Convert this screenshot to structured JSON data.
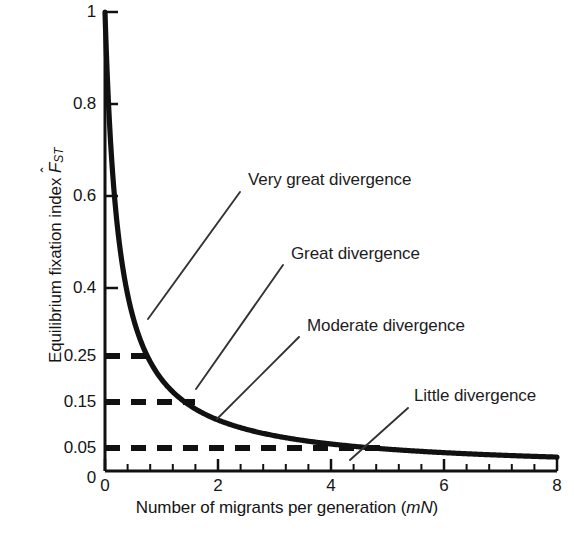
{
  "chart_data": {
    "type": "line",
    "title": "",
    "xlabel": "Number of migrants per generation (mN)",
    "xlabel_plain": "Number of migrants per generation",
    "xlabel_italic_suffix": "mN",
    "ylabel": "Equilibrium fixation index F̂ST",
    "ylabel_plain": "Equilibrium fixation index",
    "ylabel_symbol_base": "F",
    "ylabel_symbol_hat": "ˆ",
    "ylabel_symbol_sub": "ST",
    "xlim": [
      0,
      8
    ],
    "ylim": [
      0,
      1
    ],
    "grid": false,
    "legend": "none",
    "x_ticks": [
      0,
      2,
      4,
      6,
      8
    ],
    "x_tick_labels": [
      "0",
      "2",
      "4",
      "6",
      "8"
    ],
    "x_minor_tick_step": 0.4,
    "y_ticks": [
      0,
      0.05,
      0.15,
      0.25,
      0.4,
      0.6,
      0.8,
      1
    ],
    "y_tick_labels": [
      "0",
      "0.05",
      "0.15",
      "0.25",
      "0.4",
      "0.6",
      "0.8",
      "1"
    ],
    "series": [
      {
        "name": "Equilibrium Fst = 1 / (1 + 4mN)",
        "formula": "Fst = 1/(1+4*mN)",
        "x": [
          0.22,
          0.3,
          0.4,
          0.5,
          0.6,
          0.7,
          0.8,
          0.9,
          1.0,
          1.2,
          1.4,
          1.6,
          1.8,
          2.0,
          2.4,
          2.8,
          3.2,
          3.6,
          4.0,
          4.4,
          4.8,
          5.2,
          5.6,
          6.0,
          6.5,
          7.0,
          7.5,
          8.0
        ],
        "y": [
          0.532,
          0.455,
          0.385,
          0.333,
          0.294,
          0.263,
          0.238,
          0.217,
          0.2,
          0.172,
          0.152,
          0.135,
          0.122,
          0.111,
          0.094,
          0.082,
          0.072,
          0.065,
          0.059,
          0.054,
          0.049,
          0.046,
          0.043,
          0.04,
          0.037,
          0.034,
          0.032,
          0.03
        ]
      }
    ],
    "reference_lines": [
      {
        "name": "fst-0.25-dashed",
        "y": 0.25,
        "x_start": 0,
        "x_end": 0.75,
        "style": "dashed"
      },
      {
        "name": "fst-0.15-dashed",
        "y": 0.15,
        "x_start": 0,
        "x_end": 1.42,
        "style": "dashed"
      },
      {
        "name": "fst-0.05-dashed",
        "y": 0.05,
        "x_start": 0,
        "x_end": 4.7,
        "style": "dashed"
      }
    ],
    "annotations": [
      {
        "name": "very-great-divergence",
        "label": "Very great divergence",
        "text_x": 248,
        "text_y": 172,
        "leader_from_x": 240,
        "leader_from_y": 192,
        "leader_to_x": 148,
        "leader_to_y": 319
      },
      {
        "name": "great-divergence",
        "label": "Great divergence",
        "text_x": 291,
        "text_y": 246,
        "leader_from_x": 283,
        "leader_from_y": 265,
        "leader_to_x": 196,
        "leader_to_y": 389
      },
      {
        "name": "moderate-divergence",
        "label": "Moderate divergence",
        "text_x": 307,
        "text_y": 318,
        "leader_from_x": 299,
        "leader_from_y": 337,
        "leader_to_x": 217,
        "leader_to_y": 419
      },
      {
        "name": "little-divergence",
        "label": "Little divergence",
        "text_x": 414,
        "text_y": 388,
        "leader_from_x": 408,
        "leader_from_y": 408,
        "leader_to_x": 350,
        "leader_to_y": 460
      }
    ],
    "colors": {
      "curve": "#111111",
      "axis": "#111111",
      "dashed": "#111111",
      "leader": "#333333",
      "text": "#161616",
      "background": "#ffffff"
    }
  }
}
